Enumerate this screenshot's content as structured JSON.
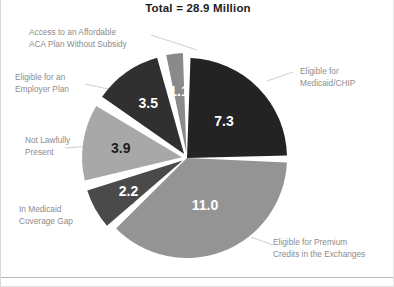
{
  "chart": {
    "title": "Total = 28.9 Million"
  },
  "chart_data": {
    "type": "pie",
    "title": "Total = 28.9 Million",
    "unit": "million people",
    "total": 28.9,
    "legend_position": "callout-labels",
    "grid": false,
    "categories": [
      "Eligible for Medicaid/CHIP",
      "Eligible for Premium Credits in the Exchanges",
      "In Medicaid Coverage Gap",
      "Not Lawfully Present",
      "Eligible for an Employer Plan",
      "Access to an Affordable ACA Plan Without Subsidy"
    ],
    "values": [
      7.3,
      11.0,
      2.2,
      3.9,
      3.5,
      1.1
    ],
    "value_labels": [
      "7.3",
      "11.0",
      "2.2",
      "3.9",
      "3.5",
      "1.1"
    ],
    "colors": [
      "#232323",
      "#949494",
      "#4a4a4a",
      "#a8a8a8",
      "#303030",
      "#8a8a8a"
    ],
    "value_label_colors": [
      "#ffffff",
      "#ffffff",
      "#ffffff",
      "#1d1d1d",
      "#ffffff",
      "#ffffff"
    ],
    "slices": [
      {
        "label": "Eligible for Medicaid/CHIP",
        "label_line1": "Eligible for",
        "label_line2": "Medicaid/CHIP",
        "value": 7.3,
        "value_label": "7.3",
        "color": "#232323",
        "start_angle_deg": 0,
        "end_angle_deg": 90.9
      },
      {
        "label": "Eligible for Premium Credits in the Exchanges",
        "label_line1": "Eligible for Premium",
        "label_line2": "Credits in the Exchanges",
        "value": 11.0,
        "value_label": "11.0",
        "color": "#949494",
        "start_angle_deg": 90.9,
        "end_angle_deg": 227.9
      },
      {
        "label": "In Medicaid Coverage Gap",
        "label_line1": "In Medicaid",
        "label_line2": "Coverage Gap",
        "value": 2.2,
        "value_label": "2.2",
        "color": "#4a4a4a",
        "start_angle_deg": 227.9,
        "end_angle_deg": 255.3
      },
      {
        "label": "Not Lawfully Present",
        "label_line1": "Not Lawfully",
        "label_line2": "Present",
        "value": 3.9,
        "value_label": "3.9",
        "color": "#a8a8a8",
        "start_angle_deg": 255.3,
        "end_angle_deg": 303.9
      },
      {
        "label": "Eligible for an Employer Plan",
        "label_line1": "Eligible for an",
        "label_line2": "Employer Plan",
        "value": 3.5,
        "value_label": "3.5",
        "color": "#303030",
        "start_angle_deg": 303.9,
        "end_angle_deg": 347.5
      },
      {
        "label": "Access to an Affordable ACA Plan Without Subsidy",
        "label_line1": "Access to an Affordable",
        "label_line2": "ACA Plan Without Subsidy",
        "value": 1.1,
        "value_label": "1.1",
        "color": "#8a8a8a",
        "start_angle_deg": 347.5,
        "end_angle_deg": 360
      }
    ]
  },
  "callouts": {
    "medicaid_chip": "Eligible for\nMedicaid/CHIP",
    "premium_credits": "Eligible for Premium\nCredits in the Exchanges",
    "coverage_gap": "In Medicaid\nCoverage Gap",
    "not_lawfully_present": "Not Lawfully\nPresent",
    "employer_plan": "Eligible for an\nEmployer Plan",
    "affordable_aca": "Access to an Affordable\nACA Plan Without Subsidy"
  },
  "slice_values": {
    "medicaid_chip": "7.3",
    "premium_credits": "11.0",
    "coverage_gap": "2.2",
    "not_lawfully_present": "3.9",
    "employer_plan": "3.5",
    "affordable_aca": "1.1"
  }
}
